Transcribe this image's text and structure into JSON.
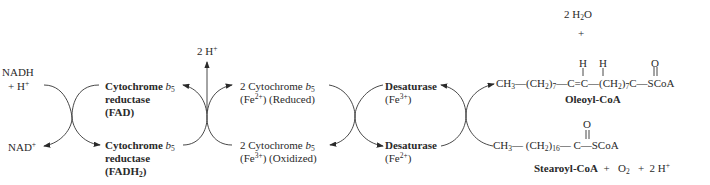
{
  "diagram": {
    "type": "electron-transport-chain",
    "left": {
      "nadh": "NADH",
      "plus_h": "+  H",
      "h_sup": "+",
      "nad": "NAD",
      "nad_sup": "+"
    },
    "reductase": {
      "top": {
        "line1": "Cytochrome ",
        "b": "b",
        "b_sub": "5",
        "line2": "reductase",
        "line3": "(FAD)"
      },
      "bottom": {
        "line1": "Cytochrome ",
        "b": "b",
        "b_sub": "5",
        "line2": "reductase",
        "line3_pre": "(FADH",
        "line3_sub": "2",
        "line3_post": ")"
      }
    },
    "protons_out": {
      "label": "2 H",
      "sup": "+"
    },
    "cytochrome_b5": {
      "top": {
        "line1": "2 Cytochrome ",
        "b": "b",
        "b_sub": "5",
        "fe_pre": "(Fe",
        "fe_sup": "2+",
        "fe_post": ")  (Reduced)"
      },
      "bottom": {
        "line1": "2 Cytochrome ",
        "b": "b",
        "b_sub": "5",
        "fe_pre": "(Fe",
        "fe_sup": "3+",
        "fe_post": ")  (Oxidized)"
      }
    },
    "desaturase": {
      "top": {
        "name": "Desaturase",
        "fe_pre": "(Fe",
        "fe_sup": "3+",
        "fe_post": ")"
      },
      "bottom": {
        "name": "Desaturase",
        "fe_pre": "(Fe",
        "fe_sup": "2+",
        "fe_post": ")"
      }
    },
    "products": {
      "water": {
        "pre": "2 H",
        "sub": "2",
        "post": "O"
      },
      "plus": "+",
      "oleoyl": {
        "h1": "H",
        "h2": "H",
        "o": "O",
        "ch3": "CH",
        "ch3_sub": "3",
        "dash1": "—",
        "ch2a_pre": "(CH",
        "ch2a_sub": "2",
        "ch2a_post": ")",
        "ch2a_n": "7",
        "c1": "—C",
        "db": "=",
        "c2": "C—",
        "ch2b_pre": "(CH",
        "ch2b_sub": "2",
        "ch2b_post": ")",
        "ch2b_n": "7",
        "c3": "C",
        "scoa": "—SCoA",
        "name": "Oleoyl-CoA"
      }
    },
    "substrates": {
      "stearoyl": {
        "o": "O",
        "ch3": "CH",
        "ch3_sub": "3",
        "dash1": "—",
        "ch2_pre": "(CH",
        "ch2_sub": "2",
        "ch2_post": ")",
        "ch2_n": "16",
        "c": "— C",
        "scoa": "—SCoA",
        "name": "Stearoyl-CoA"
      },
      "plus1": "+",
      "o2": "O",
      "o2_sub": "2",
      "plus2": "+",
      "h": "2 H",
      "h_sup": "+"
    }
  }
}
